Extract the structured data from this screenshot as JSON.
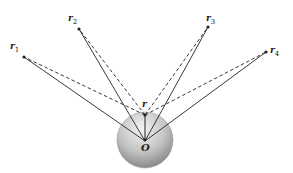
{
  "diagram": {
    "origin": {
      "label": "O",
      "x": 145,
      "y": 141
    },
    "sphere": {
      "cx": 145,
      "cy": 140,
      "r": 28,
      "fill_light": "#f2f2f2",
      "fill_dark": "#8a8a8a"
    },
    "r_point": {
      "label": "r",
      "x": 145,
      "y": 115
    },
    "vectors": [
      {
        "name": "r",
        "sub": "1",
        "x": 24,
        "y": 57,
        "lx": 10,
        "ly": 49
      },
      {
        "name": "r",
        "sub": "2",
        "x": 79,
        "y": 29,
        "lx": 68,
        "ly": 21
      },
      {
        "name": "r",
        "sub": "3",
        "x": 208,
        "y": 27,
        "lx": 206,
        "ly": 21
      },
      {
        "name": "r",
        "sub": "4",
        "x": 266,
        "y": 52,
        "lx": 270,
        "ly": 53
      }
    ],
    "line_color": "#222222",
    "solid_description": "solid lines from origin O to each source point r_i",
    "dashed_description": "dashed lines from field point r to each source point r_i"
  }
}
